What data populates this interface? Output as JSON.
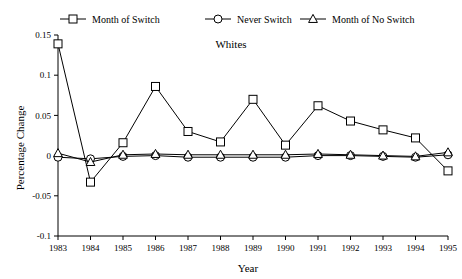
{
  "chart_data": {
    "type": "line",
    "title": "Whites",
    "xlabel": "Year",
    "ylabel": "Percentage Change",
    "x": [
      1983,
      1984,
      1985,
      1986,
      1987,
      1988,
      1989,
      1990,
      1991,
      1992,
      1993,
      1994,
      1995
    ],
    "xticklabels": [
      "1983",
      "1984",
      "1985",
      "1986",
      "1987",
      "1988",
      "1989",
      "1990",
      "1991",
      "1992",
      "1993",
      "1994",
      "1995"
    ],
    "yticklabels": [
      "-0.1",
      "-0.05",
      "0",
      "0.05",
      "0.1",
      "0.15"
    ],
    "yticks": [
      -0.1,
      -0.05,
      0,
      0.05,
      0.1,
      0.15
    ],
    "ylim": [
      -0.1,
      0.15
    ],
    "xlim": [
      1983,
      1995
    ],
    "grid": false,
    "legend_position": "top",
    "series": [
      {
        "name": "Month of Switch",
        "marker": "square",
        "values": [
          0.139,
          -0.033,
          0.016,
          0.086,
          0.03,
          0.017,
          0.07,
          0.013,
          0.062,
          0.043,
          0.032,
          0.022,
          -0.019
        ]
      },
      {
        "name": "Never Switch",
        "marker": "circle",
        "values": [
          -0.002,
          -0.004,
          -0.001,
          0.0,
          -0.002,
          -0.002,
          -0.002,
          -0.002,
          0.0,
          0.0,
          -0.001,
          -0.002,
          0.001
        ]
      },
      {
        "name": "Month of No Switch",
        "marker": "triangle",
        "values": [
          0.003,
          -0.008,
          0.001,
          0.002,
          0.001,
          0.001,
          0.001,
          0.001,
          0.002,
          0.001,
          0.0,
          -0.001,
          0.004
        ]
      }
    ]
  },
  "legend": {
    "items": [
      {
        "label": "Month of Switch"
      },
      {
        "label": "Never Switch"
      },
      {
        "label": "Month of No Switch"
      }
    ]
  }
}
